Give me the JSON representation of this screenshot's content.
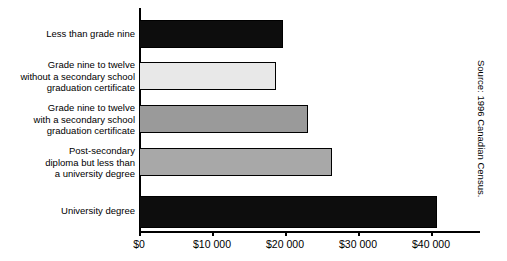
{
  "chart_data": {
    "type": "bar",
    "orientation": "horizontal",
    "title": "",
    "xlabel": "",
    "ylabel": "",
    "categories": [
      "Less than grade nine",
      "Grade nine to twelve\nwithout a secondary school\ngraduation certificate",
      "Grade nine to twelve\nwith a secondary school\ngraduation certificate",
      "Post-secondary\ndiploma but less than\na university degree",
      "University degree"
    ],
    "values": [
      19700,
      18800,
      23150,
      26400,
      40800
    ],
    "bar_colors": [
      "#0d0d0d",
      "#e8e8e8",
      "#9a9a9a",
      "#a8a8a8",
      "#0d0d0d"
    ],
    "xlim": [
      0,
      45000
    ],
    "tick_values": [
      0,
      10000,
      20000,
      30000,
      40000
    ],
    "tick_labels": [
      "$0",
      "$10 000",
      "$20 000",
      "$30 000",
      "$40 000"
    ],
    "grid": false,
    "legend": null,
    "annotations": [
      "Source: 1996 Canadian Census."
    ]
  },
  "source": {
    "text": "Source: 1996 Canadian Census."
  },
  "colors": {
    "axis": "#000000",
    "background": "#ffffff",
    "bar_dark": "#0d0d0d",
    "bar_light": "#e8e8e8",
    "bar_mid": "#9a9a9a",
    "bar_mid_light": "#a8a8a8"
  }
}
